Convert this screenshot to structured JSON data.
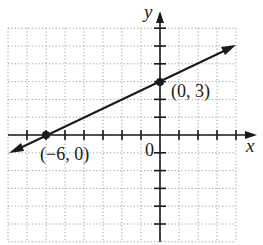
{
  "chart_data": {
    "type": "line",
    "title": "",
    "xlabel": "x",
    "ylabel": "y",
    "origin_label": "0",
    "xlim": [
      -8,
      4
    ],
    "ylim": [
      -6,
      6
    ],
    "grid": true,
    "series": [
      {
        "name": "line",
        "x": [
          -6,
          0
        ],
        "y": [
          0,
          3
        ],
        "slope": 0.5,
        "intercept": 3,
        "arrows_both_ends": true
      }
    ],
    "annotations": [
      {
        "label": "(−6, 0)",
        "x": -6,
        "y": 0
      },
      {
        "label": "(0, 3)",
        "x": 0,
        "y": 3
      }
    ]
  },
  "labels": {
    "x_axis": "x",
    "y_axis": "y",
    "origin": "0",
    "point_a": "(−6, 0)",
    "point_b": "(0, 3)"
  },
  "colors": {
    "ink": "#1a1a1a",
    "grid": "#9a9a9a"
  }
}
